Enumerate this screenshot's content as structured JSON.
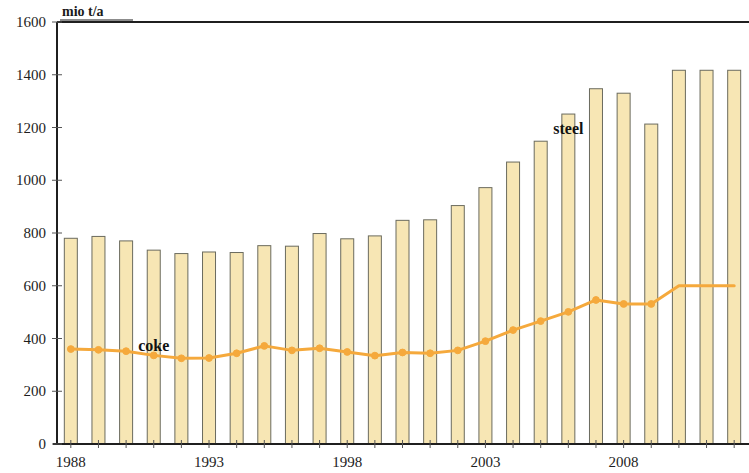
{
  "chart_data": {
    "type": "bar",
    "title": "",
    "unit_label": "mio t/a",
    "xlabel": "",
    "ylabel": "mio t/a",
    "ylim": [
      0,
      1600
    ],
    "ytick_values": [
      0,
      200,
      400,
      600,
      800,
      1000,
      1200,
      1400,
      1600
    ],
    "ytick_labels": [
      "0",
      "200",
      "400",
      "600",
      "800",
      "1000",
      "1200",
      "1400",
      "1600"
    ],
    "grid": false,
    "legend_position": "inline-annotation",
    "categories": [
      1988,
      1989,
      1990,
      1991,
      1992,
      1993,
      1994,
      1995,
      1996,
      1997,
      1998,
      1999,
      2000,
      2001,
      2002,
      2003,
      2004,
      2005,
      2006,
      2007,
      2008,
      2009,
      2010,
      2011,
      2012
    ],
    "xtick_labels": [
      "1988",
      "1993",
      "1998",
      "2003",
      "2008"
    ],
    "xtick_values": [
      1988,
      1993,
      1998,
      2003,
      2008
    ],
    "series": [
      {
        "name": "steel",
        "kind": "bar",
        "color": "#f7e6b4",
        "edge_color": "#6b6b5e",
        "values": [
          780,
          787,
          770,
          735,
          722,
          728,
          726,
          752,
          750,
          798,
          778,
          789,
          848,
          850,
          904,
          972,
          1069,
          1148,
          1251,
          1347,
          1330,
          1213,
          1417,
          1417,
          1417
        ]
      },
      {
        "name": "coke",
        "kind": "line",
        "color": "#f5a93c",
        "marker": "circle",
        "values": [
          360,
          357,
          352,
          336,
          325,
          326,
          344,
          372,
          355,
          363,
          349,
          335,
          347,
          344,
          355,
          390,
          432,
          466,
          501,
          546,
          531,
          531,
          600,
          600,
          600
        ]
      }
    ],
    "annotations": [
      {
        "name": "steel",
        "text": "steel",
        "x_index": 18,
        "y_value": 1175
      },
      {
        "name": "coke",
        "text": "coke",
        "x_index": 3,
        "y_value": 352
      }
    ]
  },
  "axes": {
    "unit_caption": "mio t/a"
  }
}
